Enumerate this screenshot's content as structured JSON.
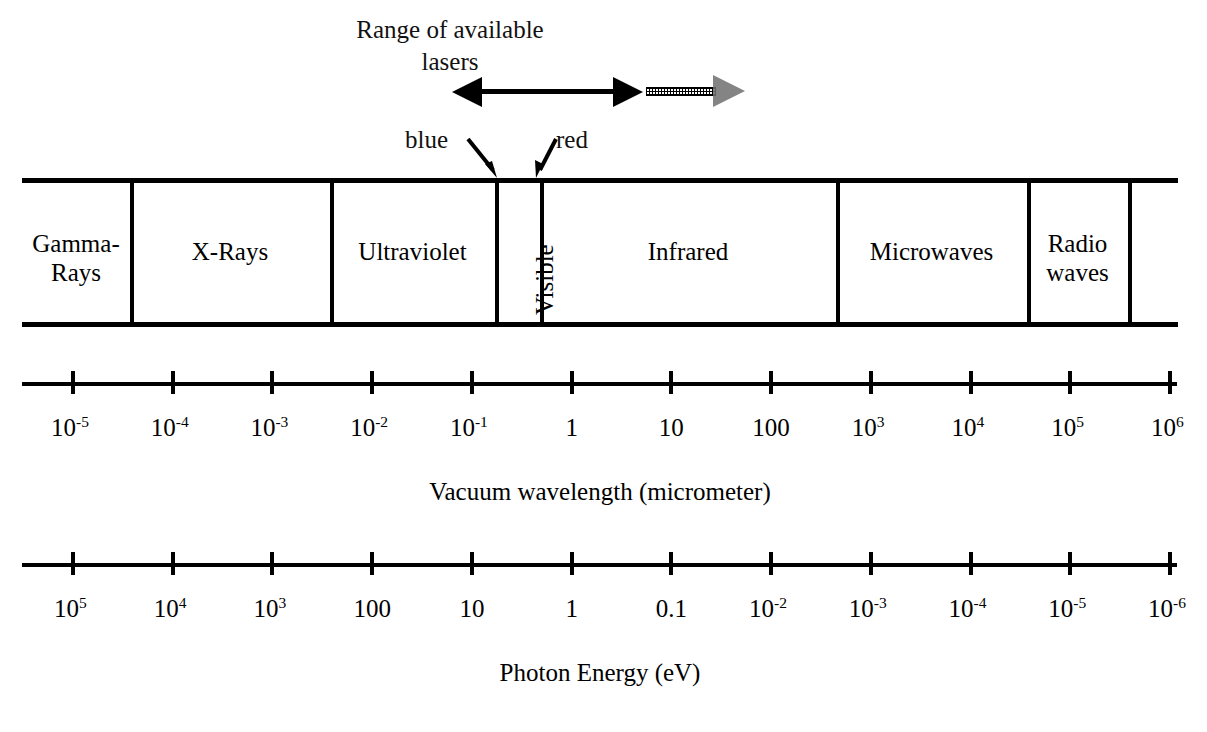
{
  "figure": {
    "background": "#ffffff",
    "ink": "#000000"
  },
  "laser_range": {
    "title_line1": "Range of available",
    "title_line2": "lasers",
    "solid_arrow_label": "laser-range-double-arrow",
    "extension_arrow_label": "laser-range-extension-arrow"
  },
  "visible_pointers": {
    "blue_label": "blue",
    "red_label": "red"
  },
  "spectrum_bands": [
    {
      "label": "Gamma-\nRays",
      "name": "band-gamma-rays",
      "x0": 22,
      "x1": 130
    },
    {
      "label": "X-Rays",
      "name": "band-x-rays",
      "x0": 130,
      "x1": 330
    },
    {
      "label": "Ultraviolet",
      "name": "band-ultraviolet",
      "x0": 330,
      "x1": 495
    },
    {
      "label": "Visible",
      "name": "band-visible",
      "x0": 495,
      "x1": 540,
      "vertical": true
    },
    {
      "label": "Infrared",
      "name": "band-infrared",
      "x0": 540,
      "x1": 836
    },
    {
      "label": "Microwaves",
      "name": "band-microwaves",
      "x0": 836,
      "x1": 1027
    },
    {
      "label": "Radio\nwaves",
      "name": "band-radio-waves",
      "x0": 1027,
      "x1": 1128
    },
    {
      "label": "",
      "name": "band-unlabeled",
      "x0": 1128,
      "x1": 1178
    }
  ],
  "chart_data": {
    "type": "table",
    "axes": [
      {
        "name": "vacuum-wavelength-axis",
        "caption": "Vacuum wavelength (micrometer)",
        "unit": "micrometer",
        "direction": "increasing left to right",
        "tick_values": [
          1e-05,
          0.0001,
          0.001,
          0.01,
          0.1,
          1,
          10,
          100,
          1000,
          10000,
          100000,
          1000000
        ],
        "tick_labels": [
          {
            "mantissa": "10",
            "exponent": "-5"
          },
          {
            "mantissa": "10",
            "exponent": "-4"
          },
          {
            "mantissa": "10",
            "exponent": "-3"
          },
          {
            "mantissa": "10",
            "exponent": "-2"
          },
          {
            "mantissa": "10",
            "exponent": "-1"
          },
          {
            "mantissa": "1",
            "exponent": ""
          },
          {
            "mantissa": "10",
            "exponent": ""
          },
          {
            "mantissa": "100",
            "exponent": ""
          },
          {
            "mantissa": "10",
            "exponent": "3"
          },
          {
            "mantissa": "10",
            "exponent": "4"
          },
          {
            "mantissa": "10",
            "exponent": "5"
          },
          {
            "mantissa": "10",
            "exponent": "6"
          }
        ]
      },
      {
        "name": "photon-energy-axis",
        "caption": "Photon Energy (eV)",
        "unit": "eV",
        "direction": "decreasing left to right",
        "tick_values": [
          100000.0,
          10000.0,
          1000.0,
          100,
          10,
          1,
          0.1,
          0.01,
          0.001,
          0.0001,
          1e-05,
          1e-06
        ],
        "tick_labels": [
          {
            "mantissa": "10",
            "exponent": "5"
          },
          {
            "mantissa": "10",
            "exponent": "4"
          },
          {
            "mantissa": "10",
            "exponent": "3"
          },
          {
            "mantissa": "100",
            "exponent": ""
          },
          {
            "mantissa": "10",
            "exponent": ""
          },
          {
            "mantissa": "1",
            "exponent": ""
          },
          {
            "mantissa": "0.1",
            "exponent": ""
          },
          {
            "mantissa": "10",
            "exponent": "-2"
          },
          {
            "mantissa": "10",
            "exponent": "-3"
          },
          {
            "mantissa": "10",
            "exponent": "-4"
          },
          {
            "mantissa": "10",
            "exponent": "-5"
          },
          {
            "mantissa": "10",
            "exponent": "-6"
          }
        ]
      }
    ],
    "bands": [
      "Gamma-Rays",
      "X-Rays",
      "Ultraviolet",
      "Visible",
      "Infrared",
      "Microwaves",
      "Radio waves"
    ],
    "annotations": [
      "Range of available lasers",
      "blue",
      "red"
    ]
  }
}
